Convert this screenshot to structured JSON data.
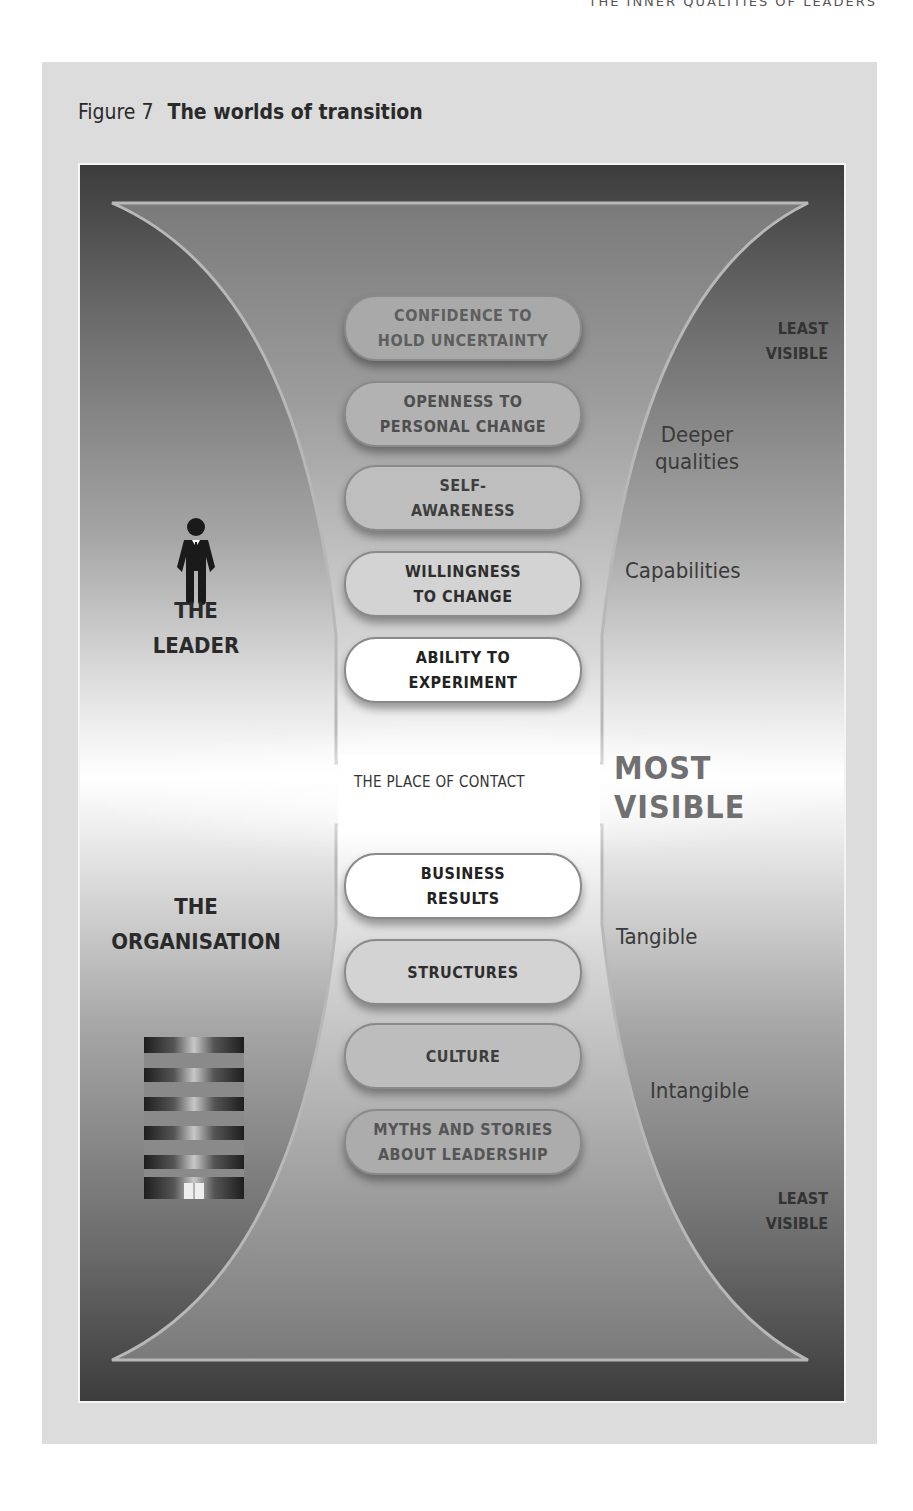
{
  "page": {
    "running_header": "The Inner Qualities of Leaders"
  },
  "figure": {
    "number_label": "Figure 7",
    "title": "The worlds of transition",
    "place_of_contact": "THE PLACE OF CONTACT",
    "most_visible": "MOST\nVISIBLE",
    "groups": {
      "leader": {
        "label": "THE\nLEADER",
        "icon": "person-in-suit-icon"
      },
      "organisation": {
        "label": "THE\nORGANISATION",
        "icon": "office-building-icon"
      }
    },
    "upper": {
      "least_visible": "LEAST\nVISIBLE",
      "descriptors": [
        "Deeper\nqualities",
        "Capabilities"
      ],
      "items": [
        {
          "label": "CONFIDENCE TO\nHOLD UNCERTAINTY",
          "fill": "#a9a9a9",
          "text_color": "#5e5e5e"
        },
        {
          "label": "OPENNESS TO\nPERSONAL CHANGE",
          "fill": "#b2b2b2",
          "text_color": "#4e4e4e"
        },
        {
          "label": "SELF-\nAWARENESS",
          "fill": "#bebebe",
          "text_color": "#3e3e3e"
        },
        {
          "label": "WILLINGNESS\nTO CHANGE",
          "fill": "#d3d3d3",
          "text_color": "#2e2e2e"
        },
        {
          "label": "ABILITY TO\nEXPERIMENT",
          "fill": "#ffffff",
          "text_color": "#222222"
        }
      ]
    },
    "lower": {
      "least_visible": "LEAST\nVISIBLE",
      "descriptors": [
        "Tangible",
        "Intangible"
      ],
      "items": [
        {
          "label": "BUSINESS\nRESULTS",
          "fill": "#ffffff",
          "text_color": "#222222"
        },
        {
          "label": "STRUCTURES",
          "fill": "#d3d3d3",
          "text_color": "#2e2e2e"
        },
        {
          "label": "CULTURE",
          "fill": "#bdbdbd",
          "text_color": "#3e3e3e"
        },
        {
          "label": "MYTHS AND STORIES\nABOUT LEADERSHIP",
          "fill": "#acacac",
          "text_color": "#555555"
        }
      ]
    }
  }
}
